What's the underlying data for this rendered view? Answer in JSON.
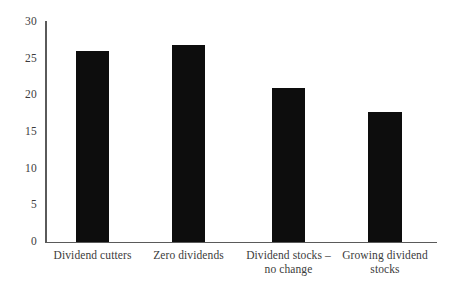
{
  "chart_data": {
    "type": "bar",
    "title": "",
    "subtitle": "",
    "xlabel": "",
    "ylabel": "",
    "categories": [
      "Dividend cutters",
      "Zero dividends",
      "Dividend stocks – no change",
      "Growing dividend stocks"
    ],
    "values": [
      26.0,
      26.9,
      21.0,
      17.7
    ],
    "ylim": [
      0,
      30
    ],
    "yticks": [
      0,
      5,
      10,
      15,
      20,
      25,
      30
    ],
    "ytick_labels": [
      "0",
      "5",
      "10",
      "15",
      "20",
      "25",
      "30"
    ],
    "grid": false,
    "legend": null,
    "bar_color": "#0d0d0d",
    "axis_color": "#5a5a5a",
    "background_color": "#ffffff",
    "text_color": "#3c3c3c"
  },
  "axes": {
    "y_ticks": [
      {
        "label": "30",
        "value": 30
      },
      {
        "label": "25",
        "value": 25
      },
      {
        "label": "20",
        "value": 20
      },
      {
        "label": "15",
        "value": 15
      },
      {
        "label": "10",
        "value": 10
      },
      {
        "label": "5",
        "value": 5
      },
      {
        "label": "0",
        "value": 0
      }
    ]
  },
  "bars": [
    {
      "label": "Dividend cutters",
      "value": 26.0,
      "x": 76,
      "width": 33
    },
    {
      "label": "Zero dividends",
      "value": 26.9,
      "x": 172,
      "width": 33
    },
    {
      "label": "Dividend stocks – no change",
      "value": 21.0,
      "x": 272,
      "width": 33
    },
    {
      "label": "Growing dividend stocks",
      "value": 17.7,
      "x": 368,
      "width": 34
    }
  ]
}
